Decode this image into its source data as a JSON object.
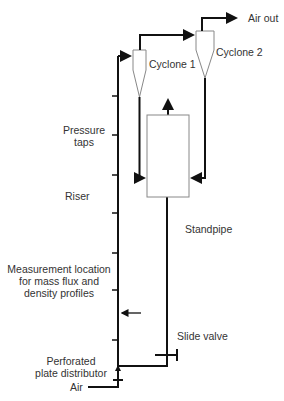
{
  "labels": {
    "air_out": "Air out",
    "cyclone1": "Cyclone 1",
    "cyclone2": "Cyclone 2",
    "pressure_taps_1": "Pressure",
    "pressure_taps_2": "taps",
    "riser": "Riser",
    "standpipe": "Standpipe",
    "measurement_1": "Measurement location",
    "measurement_2": "for mass flux and",
    "measurement_3": "density profiles",
    "slide_valve": "Slide valve",
    "distributor_1": "Perforated",
    "distributor_2": "plate distributor",
    "air": "Air"
  },
  "colors": {
    "line": "#111111",
    "outline": "#888888",
    "text": "#333333"
  }
}
